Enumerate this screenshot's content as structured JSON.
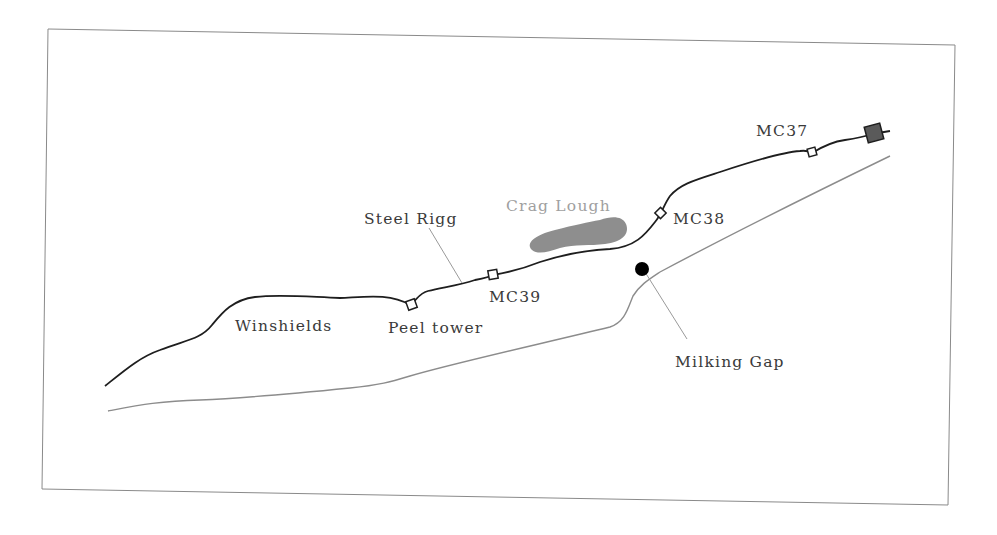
{
  "map": {
    "title": "",
    "colors": {
      "frame": "#8a8a8a",
      "wall": "#1e1e1e",
      "road": "#8c8c8c",
      "leader": "#9a9a9a",
      "lake": "#8e8e8e",
      "fort": "#5a5a5a",
      "milecastle_fill": "#ffffff",
      "milking_gap_dot": "#000000",
      "label_text": "#3a3a3a",
      "water_label_text": "#a0a0a0"
    },
    "labels": {
      "crag_lough": "Crag Lough",
      "steel_rigg": "Steel Rigg",
      "mc37": "MC37",
      "mc38": "MC38",
      "mc39": "MC39",
      "peel_tower": "Peel tower",
      "winshields": "Winshields",
      "milking_gap": "Milking Gap"
    },
    "features": [
      {
        "name": "Hadrian's Wall line",
        "type": "line",
        "style": "solid dark"
      },
      {
        "name": "Road (Military Road)",
        "type": "line",
        "style": "solid grey"
      },
      {
        "name": "Crag Lough",
        "type": "lake",
        "label": "Crag Lough"
      },
      {
        "name": "MC37",
        "type": "milecastle-marker"
      },
      {
        "name": "MC38",
        "type": "milecastle-marker"
      },
      {
        "name": "MC39",
        "type": "milecastle-marker"
      },
      {
        "name": "Peel tower",
        "type": "turret-marker"
      },
      {
        "name": "Fort",
        "type": "filled-square-marker"
      },
      {
        "name": "Milking Gap",
        "type": "point"
      }
    ]
  }
}
